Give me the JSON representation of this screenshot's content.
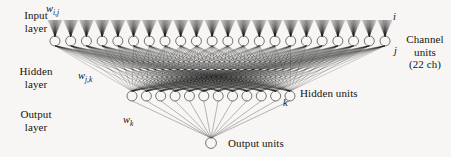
{
  "figure": {
    "background_color": "#f7f6f4",
    "line_color": "#000000"
  },
  "layer_labels": {
    "input": "Input\nlayer",
    "input_line1": "Input",
    "input_line2": "layer",
    "hidden_line1": "Hidden",
    "hidden_line2": "layer",
    "output_line1": "Output",
    "output_line2": "layer"
  },
  "weight_labels": {
    "input_to_hidden": "w",
    "input_to_hidden_sub": "i,j",
    "hidden_to_hidden": "w",
    "hidden_to_hidden_sub": "j,k",
    "hidden_to_output": "w",
    "hidden_to_output_sub": "k"
  },
  "indices": {
    "i": "i",
    "j": "j",
    "k": "k"
  },
  "annotations": {
    "channel_units_line1": "Channel",
    "channel_units_line2": "units",
    "channel_units_line3": "(22 ch)",
    "hidden_units": "Hidden units",
    "output_units": "Output units"
  },
  "chart_data": {
    "type": "diagram",
    "layers": [
      {
        "name": "Input layer",
        "role": "input",
        "unit_label": "Channel units",
        "unit_count": 22,
        "unit_count_text": "(22 ch)",
        "index_symbol": "i",
        "y": 41,
        "x_start": 55,
        "x_end": 385
      },
      {
        "name": "Hidden layer",
        "role": "hidden",
        "unit_label": "Hidden units",
        "unit_count": 12,
        "index_symbol": "j",
        "second_index_symbol": "k",
        "y": 96,
        "x_start": 132,
        "x_end": 290
      },
      {
        "name": "Output layer",
        "role": "output",
        "unit_label": "Output units",
        "unit_count": 1,
        "index_symbol": "k",
        "y": 143,
        "x_start": 211,
        "x_end": 211
      }
    ],
    "connections": [
      {
        "from": "input",
        "to": "hidden",
        "weight": "w_i,j",
        "style": "fully-connected"
      },
      {
        "from": "hidden",
        "to": "hidden2",
        "weight": "w_j,k",
        "style": "fully-connected"
      },
      {
        "from": "hidden",
        "to": "output",
        "weight": "w_k",
        "style": "fully-connected"
      }
    ]
  }
}
